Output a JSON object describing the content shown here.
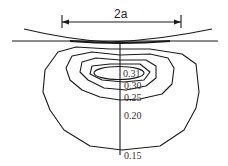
{
  "diagram": {
    "dimension_label": "2a",
    "contour_labels": [
      "0.31",
      "0.30",
      "0.25",
      "0.20",
      "0.15"
    ]
  }
}
